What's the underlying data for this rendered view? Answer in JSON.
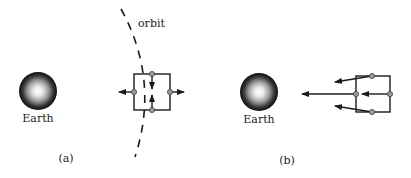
{
  "panels": [
    {
      "id": "a",
      "caption": "(a)",
      "earth_label": "Earth",
      "orbit_label": "orbit",
      "arrows": [
        "left-outward",
        "right-outward",
        "top-inward",
        "bottom-inward"
      ]
    },
    {
      "id": "b",
      "caption": "(b)",
      "earth_label": "Earth",
      "arrows": [
        "center-long-toward-earth",
        "top-toward-earth",
        "bottom-toward-earth",
        "right-toward-center"
      ]
    }
  ],
  "colors": {
    "line": "#1a1a1a",
    "dot_fill": "#9a9a9a",
    "earth_outer": "#111111",
    "earth_inner": "#ffffff"
  }
}
